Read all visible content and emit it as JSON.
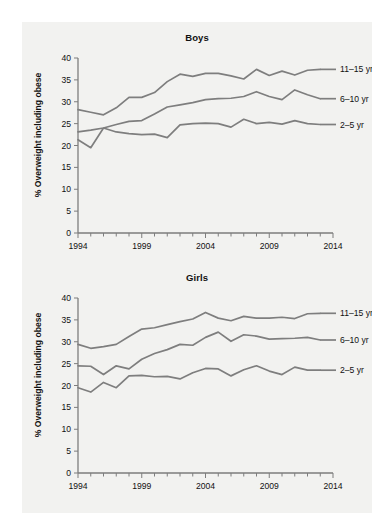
{
  "figure": {
    "background": "#ffffff",
    "panel_color": "#f2f2f0",
    "line_color": "#7e7e7e",
    "axis_color": "#7d7d7d",
    "text_color": "#111111"
  },
  "charts": [
    {
      "id": "boys",
      "title": "Boys",
      "ylabel": "% Overweight including obese",
      "xlabel": "",
      "labels": {
        "s0": "11–15 yr",
        "s1": "6–10 yr",
        "s2": "2–5 yr"
      }
    },
    {
      "id": "girls",
      "title": "Girls",
      "ylabel": "% Overweight including obese",
      "xlabel": "",
      "labels": {
        "s0": "11–15 yr",
        "s1": "6–10 yr",
        "s2": "2–5 yr"
      }
    }
  ],
  "axis": {
    "y_ticks": [
      "0",
      "5",
      "10",
      "15",
      "20",
      "25",
      "30",
      "35",
      "40"
    ],
    "x_ticks_labeled": [
      "1994",
      "1999",
      "2004",
      "2009",
      "2014"
    ],
    "ylim": [
      0,
      40
    ],
    "xlim": [
      1994,
      2014
    ]
  },
  "chart_data": [
    {
      "type": "line",
      "title": "Boys",
      "xlabel": "",
      "ylabel": "% Overweight including obese",
      "xlim": [
        1994,
        2014
      ],
      "ylim": [
        0,
        40
      ],
      "yticks": [
        0,
        5,
        10,
        15,
        20,
        25,
        30,
        35,
        40
      ],
      "xticks": [
        1994,
        1999,
        2004,
        2009,
        2014
      ],
      "xtick_labels": [
        "1994",
        "1999",
        "2004",
        "2009",
        "2014"
      ],
      "grid": false,
      "legend_position": "right-inline-labels",
      "x": [
        1994,
        1995,
        1996,
        1997,
        1998,
        1999,
        2000,
        2001,
        2002,
        2003,
        2004,
        2005,
        2006,
        2007,
        2008,
        2009,
        2010,
        2011,
        2012,
        2013
      ],
      "series": [
        {
          "name": "11–15 yr",
          "values": [
            28.2,
            27.6,
            27.0,
            28.6,
            31.0,
            31.0,
            32.1,
            34.6,
            36.3,
            35.8,
            36.5,
            36.5,
            35.9,
            35.2,
            37.4,
            36.0,
            37.0,
            36.1,
            37.2,
            37.4
          ]
        },
        {
          "name": "6–10 yr",
          "values": [
            23.1,
            23.5,
            24.0,
            24.8,
            25.5,
            25.7,
            27.2,
            28.8,
            29.3,
            29.8,
            30.5,
            30.7,
            30.8,
            31.2,
            32.3,
            31.2,
            30.5,
            32.7,
            31.6,
            30.7
          ]
        },
        {
          "name": "2–5 yr",
          "values": [
            21.3,
            19.5,
            24.0,
            23.1,
            22.7,
            22.5,
            22.6,
            21.8,
            24.7,
            25.0,
            25.1,
            25.0,
            24.2,
            26.0,
            25.0,
            25.3,
            24.9,
            25.7,
            25.0,
            24.8
          ]
        }
      ]
    },
    {
      "type": "line",
      "title": "Girls",
      "xlabel": "",
      "ylabel": "% Overweight including obese",
      "xlim": [
        1994,
        2014
      ],
      "ylim": [
        0,
        40
      ],
      "yticks": [
        0,
        5,
        10,
        15,
        20,
        25,
        30,
        35,
        40
      ],
      "xticks": [
        1994,
        1999,
        2004,
        2009,
        2014
      ],
      "xtick_labels": [
        "1994",
        "1999",
        "2004",
        "2009",
        "2014"
      ],
      "grid": false,
      "legend_position": "right-inline-labels",
      "x": [
        1994,
        1995,
        1996,
        1997,
        1998,
        1999,
        2000,
        2001,
        2002,
        2003,
        2004,
        2005,
        2006,
        2007,
        2008,
        2009,
        2010,
        2011,
        2012,
        2013
      ],
      "series": [
        {
          "name": "11–15 yr",
          "values": [
            29.4,
            28.5,
            28.9,
            29.4,
            31.2,
            32.9,
            33.2,
            33.9,
            34.6,
            35.2,
            36.7,
            35.4,
            34.8,
            35.8,
            35.4,
            35.4,
            35.6,
            35.3,
            36.4,
            36.5
          ]
        },
        {
          "name": "6–10 yr",
          "values": [
            24.5,
            24.4,
            22.5,
            24.5,
            23.8,
            26.0,
            27.3,
            28.2,
            29.4,
            29.2,
            31.0,
            32.2,
            30.1,
            31.6,
            31.3,
            30.6,
            30.7,
            30.8,
            31.0,
            30.4
          ]
        },
        {
          "name": "2–5 yr",
          "values": [
            19.5,
            18.5,
            20.7,
            19.5,
            22.2,
            22.3,
            22.0,
            22.1,
            21.5,
            22.9,
            23.9,
            23.8,
            22.2,
            23.6,
            24.5,
            23.3,
            22.5,
            24.2,
            23.5,
            23.5
          ]
        }
      ]
    }
  ]
}
